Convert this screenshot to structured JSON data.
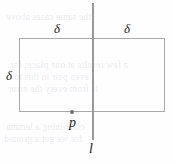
{
  "figure": {
    "kind": "geometry-diagram",
    "background_color": "#fefefe",
    "stroke_color": "#a9a9ad",
    "line_color": "#98989d",
    "text_color": "#1d1d20"
  },
  "labels": {
    "delta_top_left": "δ",
    "delta_top_right": "δ",
    "delta_left": "δ",
    "point_p": "p",
    "line_l": "l"
  },
  "icons": {
    "point_marker": "dot-marker-icon",
    "rectangle": "rectangle-shape-icon",
    "vertical_line": "vertical-line-icon"
  },
  "ghost_text": {
    "lines": [
      "the same cases above",
      "a few results at one place; for",
      "even pair in this to",
      "is from every the error",
      "combining a lemma",
      "for we get a ground"
    ]
  }
}
